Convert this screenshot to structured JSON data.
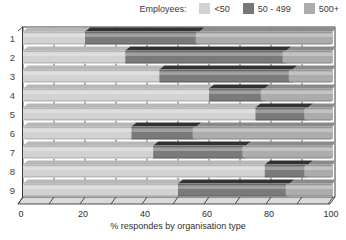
{
  "legend": {
    "title": "Employees:",
    "items": [
      {
        "label": "<50",
        "color": "#d2d2d2"
      },
      {
        "label": "50 - 499",
        "color": "#767676"
      },
      {
        "label": "500+",
        "color": "#acacac"
      }
    ]
  },
  "axis": {
    "xlabel": "% respondes by organisation type",
    "tick_labels": [
      "0",
      "20",
      "40",
      "60",
      "80",
      "100"
    ]
  },
  "chart_data": {
    "type": "bar",
    "orientation": "horizontal",
    "stacked": true,
    "style": "3d-oblique",
    "categories": [
      "1",
      "2",
      "3",
      "4",
      "5",
      "6",
      "7",
      "8",
      "9"
    ],
    "series": [
      {
        "name": "<50",
        "color": "#d2d2d2",
        "top_color": "#b7b7b7",
        "values": [
          20,
          33,
          44,
          60,
          75,
          35,
          42,
          78,
          50
        ]
      },
      {
        "name": "50 - 499",
        "color": "#7a7a7a",
        "top_color": "#323232",
        "values": [
          37,
          52,
          43,
          18,
          17,
          21,
          30,
          14,
          36
        ]
      },
      {
        "name": "500+",
        "color": "#acacac",
        "top_color": "#8a8a8a",
        "values": [
          43,
          15,
          13,
          22,
          8,
          44,
          28,
          8,
          14
        ]
      }
    ],
    "xlabel": "% respondes by organisation type",
    "xlim": [
      0,
      100
    ],
    "x_ticks": [
      0,
      20,
      40,
      60,
      80,
      100
    ],
    "grid": "vertical ticks every 10 units shown in gaps between bars",
    "legend_title": "Employees:",
    "legend_position": "top-right"
  }
}
